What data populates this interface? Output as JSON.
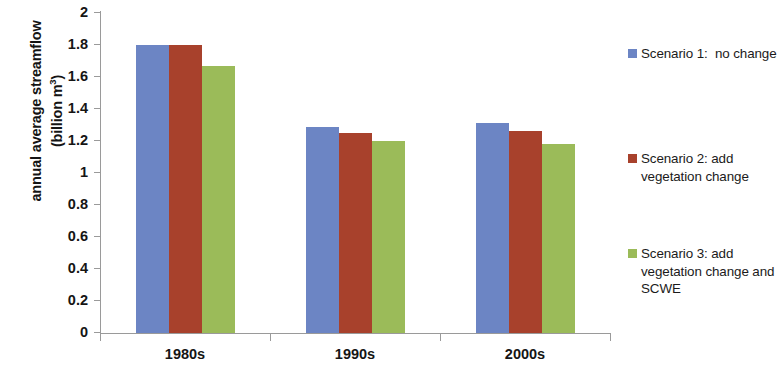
{
  "chart_data": {
    "type": "bar",
    "title": "",
    "xlabel": "",
    "ylabel": "annual average streamflow (billion m3)",
    "categories": [
      "1980s",
      "1990s",
      "2000s"
    ],
    "series": [
      {
        "name": "Scenario 1:  no change",
        "color": "#6C85C4",
        "values": [
          1.8,
          1.29,
          1.31
        ]
      },
      {
        "name": "Scenario 2: add vegetation change",
        "color": "#A8412C",
        "values": [
          1.8,
          1.25,
          1.26
        ]
      },
      {
        "name": "Scenario 3: add vegetation change and SCWE",
        "color": "#9BBB59",
        "values": [
          1.67,
          1.2,
          1.18
        ]
      }
    ],
    "ylim": [
      0,
      2
    ],
    "ytick_values": [
      0,
      0.2,
      0.4,
      0.6,
      0.8,
      1,
      1.2,
      1.4,
      1.6,
      1.8,
      2
    ],
    "ytick_labels": [
      "0",
      "0.2",
      "0.4",
      "0.6",
      "0.8",
      "1",
      "1.2",
      "1.4",
      "1.6",
      "1.8",
      "2"
    ],
    "grid": false,
    "legend_position": "right"
  },
  "axis": {
    "y_title_line1": "annual average streamflow",
    "y_title_line2_pre": "(billion m",
    "y_title_line2_sup": "3",
    "y_title_line2_post": ")"
  },
  "legend": {
    "items": [
      {
        "label": "Scenario 1:  no change",
        "color": "#6C85C4"
      },
      {
        "label": "Scenario 2: add vegetation change",
        "color": "#A8412C"
      },
      {
        "label": "Scenario 3: add vegetation change and SCWE",
        "color": "#9BBB59"
      }
    ]
  }
}
